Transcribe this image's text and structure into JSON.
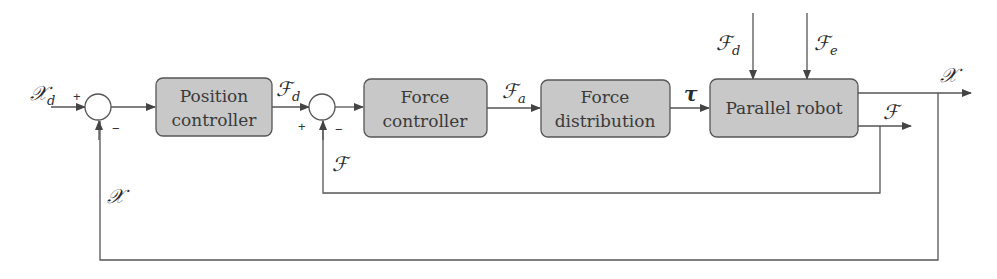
{
  "colors": {
    "block_fill": "#c8c8c8",
    "block_stroke": "#555555",
    "line": "#555555",
    "text": "#333333"
  },
  "blocks": [
    {
      "id": "position-controller",
      "line1": "Position",
      "line2": "controller"
    },
    {
      "id": "force-controller",
      "line1": "Force",
      "line2": "controller"
    },
    {
      "id": "force-distribution",
      "line1": "Force",
      "line2": "distribution"
    },
    {
      "id": "parallel-robot",
      "line1": "Parallel robot"
    }
  ],
  "summing_junctions": [
    {
      "id": "sum1",
      "plus": "+",
      "minus": "−"
    },
    {
      "id": "sum2",
      "plus": "+",
      "minus": "−"
    }
  ],
  "signals": {
    "reference_position": {
      "main": "𝒳",
      "sub": "d"
    },
    "desired_force": {
      "main": "ℱ",
      "sub": "d"
    },
    "actuator_force": {
      "main": "ℱ",
      "sub": "a"
    },
    "torque": {
      "main": "τ"
    },
    "disturbance_force": {
      "main": "ℱ",
      "sub": "d"
    },
    "environment_force": {
      "main": "ℱ",
      "sub": "e"
    },
    "output_position": {
      "main": "𝒳"
    },
    "output_force": {
      "main": "ℱ"
    },
    "force_feedback": {
      "main": "ℱ"
    },
    "position_feedback": {
      "main": "𝒳"
    }
  }
}
